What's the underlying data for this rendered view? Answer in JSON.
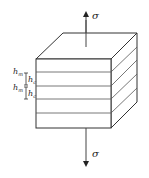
{
  "diagram": {
    "stress_label_top": "σ",
    "stress_label_bottom": "σ",
    "thickness_labels": [
      {
        "main": "h",
        "sub": "m"
      },
      {
        "main": "h",
        "sub": "c"
      },
      {
        "main": "h",
        "sub": "m"
      },
      {
        "main": "h",
        "sub": "c"
      }
    ],
    "layer_count": 5,
    "colors": {
      "stroke": "#333333",
      "background": "#ffffff"
    }
  }
}
